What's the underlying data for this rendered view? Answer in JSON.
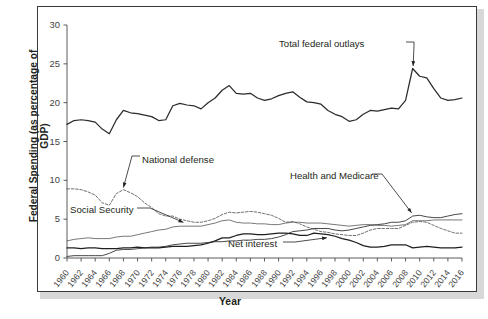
{
  "chart_data": {
    "type": "line",
    "title": "",
    "xlabel": "Year",
    "ylabel": "Federal Spending (as percentage of GDP)",
    "xlim": [
      1960,
      2016
    ],
    "ylim": [
      0,
      30
    ],
    "yticks": [
      0,
      5,
      10,
      15,
      20,
      25,
      30
    ],
    "xticks": [
      1960,
      1962,
      1964,
      1966,
      1968,
      1970,
      1972,
      1974,
      1976,
      1978,
      1980,
      1982,
      1984,
      1986,
      1988,
      1990,
      1992,
      1994,
      1996,
      1998,
      2000,
      2002,
      2004,
      2006,
      2008,
      2010,
      2012,
      2014,
      2016
    ],
    "xticklabels": [
      "1960",
      "1962",
      "1964",
      "1966",
      "1968",
      "1970",
      "1972",
      "1974",
      "1976",
      "1978",
      "1980",
      "1982",
      "1984",
      "1986",
      "1988",
      "1990",
      "1992",
      "1994",
      "1996",
      "1998",
      "2000",
      "2002",
      "2004",
      "2006",
      "2008",
      "2010",
      "2012",
      "2014",
      "2016"
    ],
    "grid": false,
    "legend": "inline-annotations",
    "x": [
      1960,
      1961,
      1962,
      1963,
      1964,
      1965,
      1966,
      1967,
      1968,
      1969,
      1970,
      1971,
      1972,
      1973,
      1974,
      1975,
      1976,
      1977,
      1978,
      1979,
      1980,
      1981,
      1982,
      1983,
      1984,
      1985,
      1986,
      1987,
      1988,
      1989,
      1990,
      1991,
      1992,
      1993,
      1994,
      1995,
      1996,
      1997,
      1998,
      1999,
      2000,
      2001,
      2002,
      2003,
      2004,
      2005,
      2006,
      2007,
      2008,
      2009,
      2010,
      2011,
      2012,
      2013,
      2014,
      2015,
      2016
    ],
    "series": [
      {
        "name": "Total federal outlays",
        "style": "solid",
        "color": "#2b2b2b",
        "values": [
          17.2,
          17.7,
          17.8,
          17.7,
          17.5,
          16.6,
          16.0,
          17.8,
          19.0,
          18.7,
          18.6,
          18.4,
          18.2,
          17.7,
          17.8,
          19.6,
          19.9,
          19.7,
          19.6,
          19.2,
          20.0,
          20.6,
          21.6,
          22.2,
          21.2,
          21.1,
          21.2,
          20.6,
          20.3,
          20.5,
          20.9,
          21.2,
          21.4,
          20.7,
          20.1,
          20.0,
          19.8,
          19.0,
          18.5,
          18.2,
          17.6,
          17.8,
          18.5,
          19.0,
          18.9,
          19.1,
          19.3,
          19.2,
          20.3,
          24.4,
          23.4,
          23.2,
          21.8,
          20.6,
          20.3,
          20.4,
          20.6
        ]
      },
      {
        "name": "National defense",
        "style": "dashed",
        "color": "#4a4a4a",
        "values": [
          8.9,
          8.9,
          8.8,
          8.5,
          8.1,
          7.1,
          6.8,
          8.3,
          8.8,
          8.4,
          7.9,
          7.1,
          6.5,
          5.7,
          5.4,
          5.4,
          5.0,
          4.8,
          4.6,
          4.6,
          4.8,
          5.1,
          5.6,
          5.9,
          5.8,
          5.9,
          6.0,
          5.9,
          5.7,
          5.5,
          5.1,
          4.6,
          4.7,
          4.4,
          4.0,
          3.7,
          3.4,
          3.3,
          3.1,
          3.0,
          2.9,
          2.9,
          3.2,
          3.6,
          3.8,
          3.8,
          3.8,
          3.8,
          4.2,
          4.6,
          4.7,
          4.6,
          4.2,
          3.8,
          3.5,
          3.2,
          3.2
        ]
      },
      {
        "name": "Social Security",
        "style": "solid-thin",
        "color": "#555555",
        "values": [
          2.2,
          2.4,
          2.5,
          2.6,
          2.5,
          2.5,
          2.5,
          2.7,
          2.8,
          2.8,
          3.0,
          3.2,
          3.4,
          3.6,
          3.7,
          4.0,
          4.1,
          4.1,
          4.1,
          4.1,
          4.3,
          4.5,
          4.8,
          4.9,
          4.6,
          4.5,
          4.5,
          4.4,
          4.4,
          4.3,
          4.3,
          4.5,
          4.6,
          4.6,
          4.5,
          4.5,
          4.5,
          4.4,
          4.3,
          4.2,
          4.1,
          4.2,
          4.3,
          4.3,
          4.2,
          4.2,
          4.1,
          4.2,
          4.3,
          4.8,
          4.8,
          4.8,
          4.9,
          4.9,
          4.9,
          4.9,
          4.9
        ]
      },
      {
        "name": "Health and Medicare",
        "style": "solid-mid",
        "color": "#3d3d3d",
        "values": [
          0.2,
          0.3,
          0.3,
          0.3,
          0.3,
          0.3,
          0.6,
          1.0,
          1.1,
          1.1,
          1.2,
          1.3,
          1.4,
          1.4,
          1.5,
          1.7,
          1.8,
          1.9,
          1.9,
          1.9,
          2.0,
          2.1,
          2.1,
          2.2,
          2.2,
          2.3,
          2.3,
          2.4,
          2.4,
          2.5,
          2.7,
          3.0,
          3.4,
          3.5,
          3.6,
          3.8,
          3.8,
          3.8,
          3.6,
          3.5,
          3.6,
          3.8,
          4.0,
          4.2,
          4.3,
          4.4,
          4.6,
          4.6,
          4.8,
          5.4,
          5.5,
          5.3,
          5.2,
          5.2,
          5.4,
          5.6,
          5.7
        ]
      },
      {
        "name": "Net interest",
        "style": "solid-dark",
        "color": "#1f1f1f",
        "values": [
          1.3,
          1.3,
          1.2,
          1.3,
          1.3,
          1.2,
          1.2,
          1.2,
          1.3,
          1.3,
          1.4,
          1.3,
          1.3,
          1.3,
          1.4,
          1.5,
          1.5,
          1.5,
          1.6,
          1.7,
          1.9,
          2.2,
          2.6,
          2.6,
          2.9,
          3.1,
          3.1,
          3.0,
          3.0,
          3.1,
          3.2,
          3.2,
          3.1,
          2.9,
          2.9,
          3.2,
          3.1,
          3.0,
          2.8,
          2.5,
          2.3,
          2.0,
          1.6,
          1.4,
          1.4,
          1.5,
          1.7,
          1.7,
          1.7,
          1.3,
          1.4,
          1.5,
          1.4,
          1.3,
          1.3,
          1.3,
          1.4
        ]
      }
    ],
    "annotations": [
      {
        "text": "Total federal outlays",
        "target_year": 2009,
        "target_value": 24.4
      },
      {
        "text": "National defense",
        "target_year": 1968,
        "target_value": 8.8
      },
      {
        "text": "Social Security",
        "target_year": 1976,
        "target_value": 4.1
      },
      {
        "text": "Health and Medicare",
        "target_year": 2009,
        "target_value": 5.4
      },
      {
        "text": "Net interest",
        "target_year": 1997,
        "target_value": 3.0
      }
    ]
  },
  "axis": {
    "ytitle": "Federal Spending (as percentage of GDP)",
    "xtitle": "Year",
    "ylabels": [
      "30",
      "25",
      "20",
      "15",
      "10",
      "5",
      "0"
    ]
  },
  "annotations": {
    "total": "Total federal outlays",
    "defense": "National defense",
    "social": "Social Security",
    "health": "Health and Medicare",
    "interest": "Net interest"
  }
}
